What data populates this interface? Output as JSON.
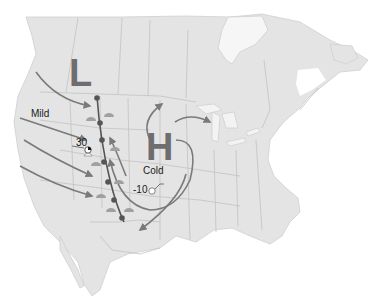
{
  "map": {
    "title": "",
    "region": "North America",
    "colors": {
      "land": "#e4e4e4",
      "borders": "#bdbdbd",
      "water": "#ffffff",
      "pressure_letters": "#6e6e6e",
      "arrows": "#7a7a7a",
      "front": "#555555"
    },
    "pressure_systems": [
      {
        "type": "low",
        "letter": "L"
      },
      {
        "type": "high",
        "letter": "H"
      }
    ],
    "air_masses": [
      {
        "label": "Mild"
      },
      {
        "label": "Cold"
      }
    ],
    "station_temps": [
      {
        "value": "30"
      },
      {
        "value": "-10"
      }
    ],
    "icons": [
      "cold-front-icon",
      "airflow-arrow-icon",
      "weather-station-icon",
      "precipitation-icon"
    ]
  }
}
